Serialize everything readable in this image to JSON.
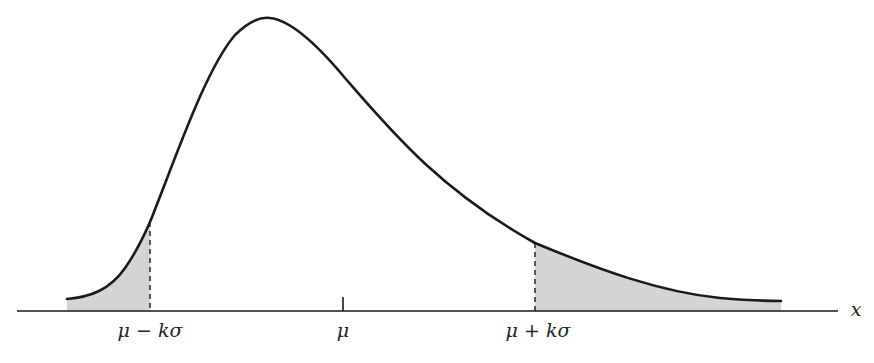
{
  "diagram": {
    "axis_label": "x",
    "labels": {
      "left_bound": "μ − kσ",
      "mean": "μ",
      "right_bound": "μ + kσ"
    },
    "colors": {
      "curve": "#1a1a1a",
      "shade": "#d4d4d4",
      "axis": "#1a1a1a"
    }
  }
}
